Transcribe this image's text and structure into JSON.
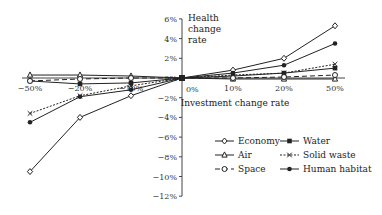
{
  "chart_data": {
    "type": "line",
    "title": "",
    "xlabel": "Investment change rate",
    "ylabel": "Health change rate",
    "ylabel_lines": [
      "Health",
      "change",
      "rate"
    ],
    "x": [
      "-50%",
      "-20%",
      "-10%",
      "0%",
      "10%",
      "20%",
      "50%"
    ],
    "x_tick_labels": [
      "−50%",
      "−20%",
      "−10%",
      "0%",
      "10%",
      "20%",
      "50%"
    ],
    "y_ticks": [
      6,
      4,
      2,
      0,
      -2,
      -4,
      -6,
      -8,
      -10,
      -12
    ],
    "y_tick_labels": [
      "6%",
      "4%",
      "2%",
      "0%",
      "−2%",
      "−4%",
      "−6%",
      "−8%",
      "−10%",
      "−12%"
    ],
    "ylim": [
      -12,
      6
    ],
    "grid": false,
    "legend_position": "lower right",
    "series": [
      {
        "name": "Economy",
        "marker": "open-diamond",
        "line": "solid",
        "values": [
          -9.5,
          -4.0,
          -1.8,
          0,
          0.8,
          2.0,
          5.3
        ]
      },
      {
        "name": "Water",
        "marker": "filled-square",
        "line": "solid",
        "values": [
          -0.3,
          -0.6,
          -0.5,
          0,
          0.2,
          0.5,
          1.0
        ]
      },
      {
        "name": "Air",
        "marker": "open-triangle",
        "line": "solid",
        "values": [
          0.3,
          0.3,
          0.2,
          0,
          -0.1,
          -0.1,
          -0.1
        ]
      },
      {
        "name": "Solid waste",
        "marker": "x",
        "line": "dotted",
        "values": [
          -3.6,
          -1.8,
          -0.8,
          0,
          0.3,
          0.5,
          1.4
        ]
      },
      {
        "name": "Space",
        "marker": "open-circle",
        "line": "dashed",
        "values": [
          -0.3,
          -0.1,
          0.0,
          0,
          0.0,
          0.1,
          0.3
        ]
      },
      {
        "name": "Human habitat",
        "marker": "filled-circle",
        "line": "solid",
        "values": [
          -4.5,
          -1.9,
          -1.2,
          0,
          0.5,
          1.3,
          3.5
        ]
      }
    ]
  },
  "legend": {
    "items": [
      "Economy",
      "Water",
      "Air",
      "Solid waste",
      "Space",
      "Human habitat"
    ]
  },
  "colors": {
    "line": "#222222",
    "axis": "#444444"
  }
}
